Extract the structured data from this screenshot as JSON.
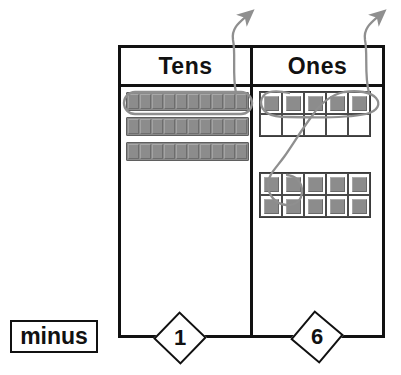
{
  "table": {
    "columns": [
      {
        "id": "tens",
        "header": "Tens"
      },
      {
        "id": "ones",
        "header": "Ones"
      }
    ]
  },
  "tens_column": {
    "rod_count": 3,
    "cubes_per_rod": 10,
    "total_value": 30,
    "lassoed_rods": 1,
    "rod_label": "ten-rod"
  },
  "ones_column": {
    "grids": [
      {
        "id": "top",
        "rows": 2,
        "cols": 5,
        "filled": 5,
        "filled_positions": [
          1,
          1,
          1,
          1,
          1,
          0,
          0,
          0,
          0,
          0
        ]
      },
      {
        "id": "bottom",
        "rows": 2,
        "cols": 5,
        "filled": 10,
        "filled_positions": [
          1,
          1,
          1,
          1,
          1,
          1,
          1,
          1,
          1,
          1
        ]
      }
    ],
    "total_value": 15,
    "lassoed_units": 6,
    "unit_label": "unit-cube"
  },
  "annotations": {
    "arrows": [
      {
        "id": "tens-removal-arrow",
        "from": "tens-lasso",
        "direction": "up-right"
      },
      {
        "id": "ones-removal-arrow",
        "from": "ones-lasso",
        "direction": "up-right"
      }
    ],
    "lassos": [
      {
        "id": "tens-lasso",
        "encircles": "top ten-rod"
      },
      {
        "id": "ones-lasso",
        "encircles": "five top unit cubes plus one bottom-left unit cube"
      }
    ],
    "color": "#8f8f8f"
  },
  "operation": {
    "label": "minus",
    "cards": [
      {
        "id": "tens-place-card",
        "value": "1"
      },
      {
        "id": "ones-place-card",
        "value": "6"
      }
    ],
    "subtrahend": "16"
  },
  "colors": {
    "ink": "#111111",
    "block_fill": "#8c8c8c",
    "block_edge": "#6a6a6a",
    "annotation": "#8f8f8f",
    "paper": "#ffffff"
  }
}
